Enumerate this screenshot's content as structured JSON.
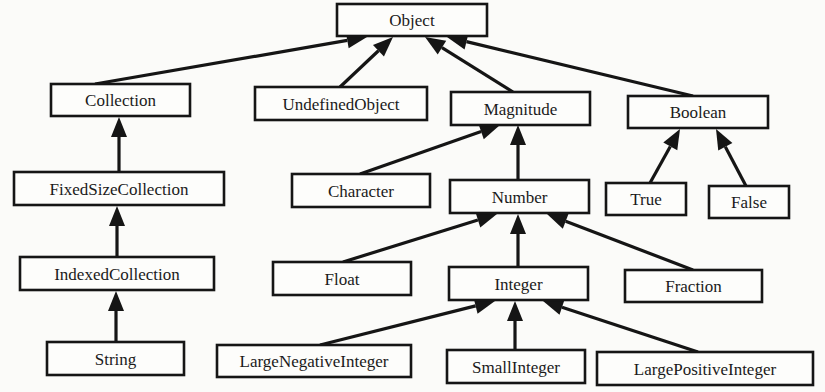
{
  "diagram": {
    "type": "class-hierarchy",
    "nodes": [
      {
        "id": "Object",
        "label": "Object",
        "x": 337,
        "y": 4,
        "w": 150,
        "h": 32
      },
      {
        "id": "Collection",
        "label": "Collection",
        "x": 51,
        "y": 84,
        "w": 139,
        "h": 32
      },
      {
        "id": "UndefinedObject",
        "label": "UndefinedObject",
        "x": 255,
        "y": 87,
        "w": 172,
        "h": 33
      },
      {
        "id": "Magnitude",
        "label": "Magnitude",
        "x": 451,
        "y": 92,
        "w": 139,
        "h": 33
      },
      {
        "id": "Boolean",
        "label": "Boolean",
        "x": 628,
        "y": 96,
        "w": 140,
        "h": 32
      },
      {
        "id": "FixedSizeCollection",
        "label": "FixedSizeCollection",
        "x": 14,
        "y": 172,
        "w": 210,
        "h": 33
      },
      {
        "id": "Character",
        "label": "Character",
        "x": 292,
        "y": 174,
        "w": 138,
        "h": 33
      },
      {
        "id": "Number",
        "label": "Number",
        "x": 450,
        "y": 180,
        "w": 139,
        "h": 33
      },
      {
        "id": "True",
        "label": "True",
        "x": 606,
        "y": 183,
        "w": 80,
        "h": 32
      },
      {
        "id": "False",
        "label": "False",
        "x": 709,
        "y": 186,
        "w": 80,
        "h": 32
      },
      {
        "id": "IndexedCollection",
        "label": "IndexedCollection",
        "x": 20,
        "y": 257,
        "w": 194,
        "h": 33
      },
      {
        "id": "Float",
        "label": "Float",
        "x": 273,
        "y": 262,
        "w": 138,
        "h": 33
      },
      {
        "id": "Integer",
        "label": "Integer",
        "x": 449,
        "y": 267,
        "w": 139,
        "h": 33
      },
      {
        "id": "Fraction",
        "label": "Fraction",
        "x": 625,
        "y": 270,
        "w": 137,
        "h": 32
      },
      {
        "id": "String",
        "label": "String",
        "x": 47,
        "y": 342,
        "w": 137,
        "h": 33
      },
      {
        "id": "LargeNegativeInteger",
        "label": "LargeNegativeInteger",
        "x": 217,
        "y": 345,
        "w": 194,
        "h": 32
      },
      {
        "id": "SmallInteger",
        "label": "SmallInteger",
        "x": 447,
        "y": 350,
        "w": 138,
        "h": 33
      },
      {
        "id": "LargePositiveInteger",
        "label": "LargePositiveInteger",
        "x": 597,
        "y": 352,
        "w": 216,
        "h": 33
      }
    ],
    "edges": [
      {
        "from": "Collection",
        "to": "Object",
        "x1": 95,
        "y1": 84,
        "x2": 367,
        "y2": 37
      },
      {
        "from": "UndefinedObject",
        "to": "Object",
        "x1": 340,
        "y1": 87,
        "x2": 393,
        "y2": 37
      },
      {
        "from": "Magnitude",
        "to": "Object",
        "x1": 513,
        "y1": 92,
        "x2": 425,
        "y2": 37
      },
      {
        "from": "Boolean",
        "to": "Object",
        "x1": 693,
        "y1": 96,
        "x2": 447,
        "y2": 37
      },
      {
        "from": "FixedSizeCollection",
        "to": "Collection",
        "x1": 119,
        "y1": 172,
        "x2": 119,
        "y2": 117
      },
      {
        "from": "Character",
        "to": "Magnitude",
        "x1": 360,
        "y1": 174,
        "x2": 500,
        "y2": 125
      },
      {
        "from": "Number",
        "to": "Magnitude",
        "x1": 518,
        "y1": 180,
        "x2": 518,
        "y2": 125
      },
      {
        "from": "True",
        "to": "Boolean",
        "x1": 650,
        "y1": 183,
        "x2": 680,
        "y2": 129
      },
      {
        "from": "False",
        "to": "Boolean",
        "x1": 746,
        "y1": 186,
        "x2": 716,
        "y2": 129
      },
      {
        "from": "IndexedCollection",
        "to": "FixedSizeCollection",
        "x1": 117,
        "y1": 257,
        "x2": 117,
        "y2": 206
      },
      {
        "from": "String",
        "to": "IndexedCollection",
        "x1": 116,
        "y1": 342,
        "x2": 116,
        "y2": 291
      },
      {
        "from": "Float",
        "to": "Number",
        "x1": 343,
        "y1": 262,
        "x2": 497,
        "y2": 214
      },
      {
        "from": "Integer",
        "to": "Number",
        "x1": 518,
        "y1": 267,
        "x2": 518,
        "y2": 214
      },
      {
        "from": "Fraction",
        "to": "Number",
        "x1": 693,
        "y1": 270,
        "x2": 547,
        "y2": 214
      },
      {
        "from": "LargeNegativeInteger",
        "to": "Integer",
        "x1": 320,
        "y1": 345,
        "x2": 495,
        "y2": 301
      },
      {
        "from": "SmallInteger",
        "to": "Integer",
        "x1": 515,
        "y1": 350,
        "x2": 515,
        "y2": 301
      },
      {
        "from": "LargePositiveInteger",
        "to": "Integer",
        "x1": 698,
        "y1": 352,
        "x2": 543,
        "y2": 301
      }
    ]
  }
}
